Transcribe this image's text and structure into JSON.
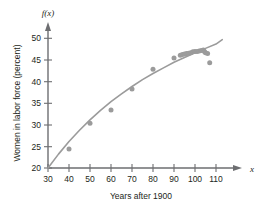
{
  "chart_data": {
    "type": "scatter",
    "title": "",
    "xlabel": "Years after 1900",
    "ylabel": "Women in labor force (percent)",
    "y_axis_function_label": "f(x)",
    "x_axis_variable_label": "x",
    "xlim": [
      30,
      115
    ],
    "ylim": [
      20,
      52
    ],
    "xticks": [
      30,
      40,
      50,
      60,
      70,
      80,
      90,
      100,
      110
    ],
    "yticks": [
      20,
      25,
      30,
      35,
      40,
      45,
      50
    ],
    "grid": false,
    "legend": null,
    "point_color": "#9b9b9b",
    "curve_color": "#9b9b9b",
    "axis_color": "#6d6e71",
    "series": [
      {
        "name": "Women in labor force (percent)",
        "kind": "scatter",
        "points": [
          [
            40,
            24.4
          ],
          [
            50,
            30.3
          ],
          [
            60,
            33.4
          ],
          [
            70,
            38.2
          ],
          [
            80,
            42.8
          ],
          [
            90,
            45.4
          ],
          [
            93,
            46.0
          ],
          [
            94,
            46.2
          ],
          [
            95,
            46.3
          ],
          [
            96,
            46.4
          ],
          [
            97,
            46.5
          ],
          [
            98,
            46.6
          ],
          [
            99,
            46.8
          ],
          [
            100,
            46.9
          ],
          [
            101,
            46.9
          ],
          [
            102,
            47.0
          ],
          [
            103,
            47.1
          ],
          [
            104,
            47.2
          ],
          [
            104.5,
            46.9
          ],
          [
            105,
            46.6
          ],
          [
            106,
            46.4
          ],
          [
            107,
            44.3
          ]
        ]
      },
      {
        "name": "regression curve",
        "kind": "line",
        "points": [
          [
            30,
            20.0
          ],
          [
            35,
            23.2
          ],
          [
            40,
            26.1
          ],
          [
            45,
            28.7
          ],
          [
            50,
            31.1
          ],
          [
            55,
            33.3
          ],
          [
            60,
            35.3
          ],
          [
            65,
            37.1
          ],
          [
            70,
            38.8
          ],
          [
            75,
            40.4
          ],
          [
            80,
            41.8
          ],
          [
            85,
            43.1
          ],
          [
            90,
            44.4
          ],
          [
            95,
            45.5
          ],
          [
            100,
            46.6
          ],
          [
            105,
            47.6
          ],
          [
            110,
            48.6
          ],
          [
            113,
            49.6
          ]
        ]
      }
    ]
  }
}
